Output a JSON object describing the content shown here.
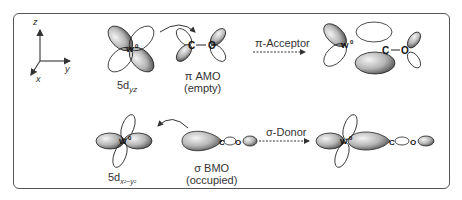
{
  "figure": {
    "axes": {
      "z": "z",
      "y": "y",
      "x": "x"
    },
    "top_row": {
      "metal_orbital": {
        "label_main": "5d",
        "label_sub": "yz",
        "center_atom": "W",
        "center_charge": "0"
      },
      "ligand_orbital": {
        "title": "π AMO",
        "subtitle": "(empty)",
        "atoms": [
          "C",
          "O"
        ]
      },
      "interaction_label": "π-Acceptor",
      "result": {
        "center_atom": "W",
        "center_charge": "0",
        "atoms": [
          "C",
          "O"
        ]
      }
    },
    "bottom_row": {
      "metal_orbital": {
        "label_main": "5d",
        "label_sub": "x²−y²",
        "center_atom": "W",
        "center_charge": "0"
      },
      "ligand_orbital": {
        "title": "σ BMO",
        "subtitle": "(occupied)",
        "atoms": [
          "C",
          "O"
        ]
      },
      "interaction_label": "σ-Donor",
      "result": {
        "center_atom": "W",
        "center_charge": "0",
        "atoms": [
          "C",
          "O"
        ]
      }
    },
    "colors": {
      "frame": "#555555",
      "lobe_shaded": "#9a9a9a",
      "lobe_outline": "#222222",
      "arrow": "#333333"
    }
  }
}
